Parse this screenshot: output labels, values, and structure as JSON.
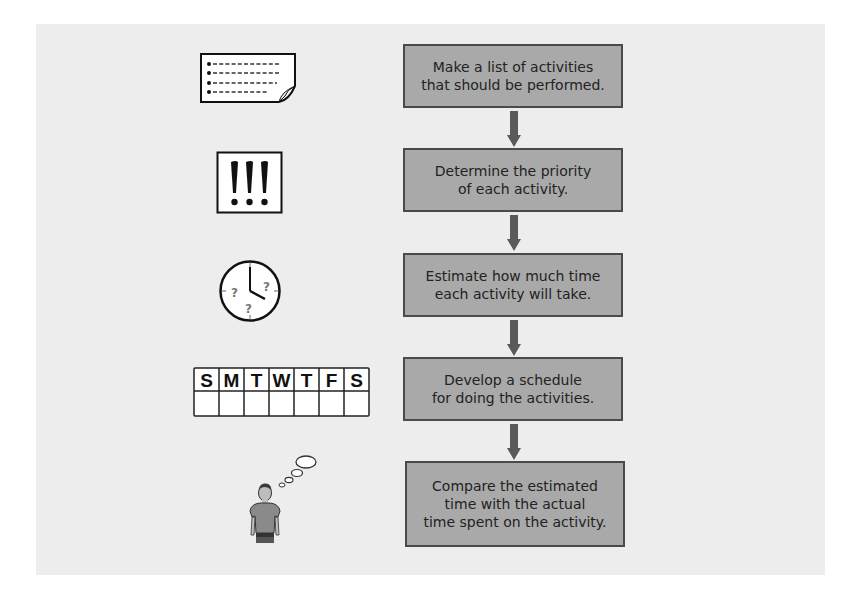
{
  "diagram": {
    "type": "flowchart",
    "direction": "top-to-bottom",
    "colors": {
      "page_background": "#ffffff",
      "panel_background": "#ededed",
      "box_fill": "#a9a9a9",
      "box_border": "#4a4a4a",
      "arrow": "#5a5a5a",
      "text": "#222222"
    },
    "steps": [
      {
        "label": "Make a list of activities\nthat should be performed.",
        "icon": "list-note-icon"
      },
      {
        "label": "Determine the priority\nof each activity.",
        "icon": "exclamation-marks-icon"
      },
      {
        "label": "Estimate how much time\neach activity will take.",
        "icon": "clock-question-icon"
      },
      {
        "label": "Develop a schedule\nfor doing the activities.",
        "icon": "weekly-calendar-icon"
      },
      {
        "label": "Compare the estimated\ntime with the actual\ntime spent on the activity.",
        "icon": "thinking-person-icon"
      }
    ],
    "calendar_days": [
      "S",
      "M",
      "T",
      "W",
      "T",
      "F",
      "S"
    ],
    "clock_marks": [
      "?",
      "?",
      "?"
    ],
    "priority_marks": "!!!"
  }
}
